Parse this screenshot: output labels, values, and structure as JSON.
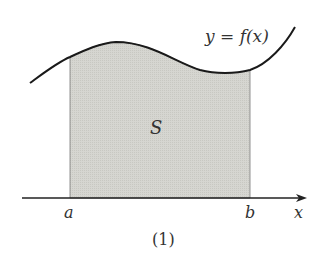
{
  "diagram": {
    "curve_label": "y = f(x)",
    "region_label": "S",
    "lower_bound_label": "a",
    "upper_bound_label": "b",
    "axis_label": "x",
    "caption": "(1)",
    "colors": {
      "region_fill": "#d4d4cf",
      "curve": "#1a1a1a",
      "axis": "#222222",
      "text": "#333333"
    }
  }
}
